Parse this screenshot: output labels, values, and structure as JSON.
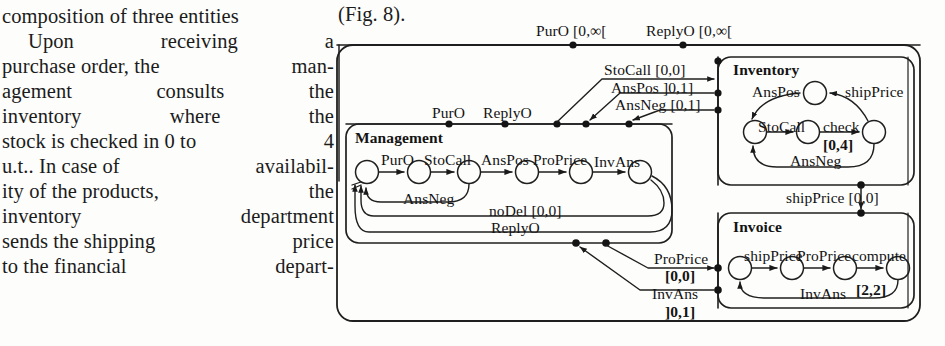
{
  "document_text": {
    "lines": [
      {
        "text": "composition of three entities",
        "type": "plain"
      },
      {
        "type": "just",
        "indent": true,
        "words": [
          "Upon",
          "receiving",
          "a"
        ]
      },
      {
        "type": "just",
        "words": [
          "purchase order, the",
          "man-"
        ]
      },
      {
        "type": "just",
        "words": [
          "agement",
          "consults",
          "the"
        ]
      },
      {
        "type": "just",
        "words": [
          "inventory",
          "where",
          "the"
        ]
      },
      {
        "type": "just",
        "words": [
          "stock is checked in 0 to",
          "4"
        ]
      },
      {
        "type": "just",
        "words": [
          "u.t.. In case of",
          "availabil-"
        ]
      },
      {
        "type": "just",
        "words": [
          "ity of the products,",
          "the"
        ]
      },
      {
        "type": "just",
        "words": [
          "inventory",
          "department"
        ]
      },
      {
        "type": "just",
        "words": [
          "sends the shipping",
          "price"
        ]
      },
      {
        "type": "just",
        "words": [
          "to the financial",
          "depart-"
        ]
      }
    ],
    "figure_ref": "(Fig. 8)."
  },
  "figure": {
    "caption_inline": "(Fig. 8).",
    "outer_port_labels": [
      {
        "id": "puro-top",
        "text": "PurO [0,∞["
      },
      {
        "id": "replyo-top",
        "text": "ReplyO [0,∞["
      }
    ],
    "connector_labels": [
      {
        "id": "stocall-conn",
        "text": "StoCall",
        "interval": "[0,0]"
      },
      {
        "id": "anspos-conn",
        "text": "AnsPos",
        "interval": "]0,1]"
      },
      {
        "id": "ansneg-conn",
        "text": "AnsNeg",
        "interval": "[0,1]"
      },
      {
        "id": "shipprice-conn",
        "text": "shipPrice",
        "interval": "[0,0]"
      },
      {
        "id": "proprice-conn",
        "text": "ProPrice",
        "interval": "[0,0]"
      },
      {
        "id": "invans-conn",
        "text": "InvAns",
        "interval": "]0,1]"
      }
    ],
    "bus_labels": [
      {
        "id": "bus-puro",
        "text": "PurO"
      },
      {
        "id": "bus-replyo",
        "text": "ReplyO"
      }
    ],
    "components": [
      {
        "id": "management",
        "title": "Management",
        "states": 6,
        "transitions": [
          {
            "label": "PurO",
            "interval": ""
          },
          {
            "label": "StoCall",
            "interval": ""
          },
          {
            "label": "AnsPos",
            "interval": ""
          },
          {
            "label": "ProPrice",
            "interval": ""
          },
          {
            "label": "InvAns",
            "interval": ""
          },
          {
            "label": "AnsNeg",
            "interval": ""
          },
          {
            "label": "noDel",
            "interval": "[0,0]"
          },
          {
            "label": "ReplyO",
            "interval": ""
          }
        ]
      },
      {
        "id": "inventory",
        "title": "Inventory",
        "states": 4,
        "transitions": [
          {
            "label": "StoCall",
            "interval": ""
          },
          {
            "label": "check",
            "interval": "[0,4]"
          },
          {
            "label": "shipPrice",
            "interval": ""
          },
          {
            "label": "AnsPos",
            "interval": ""
          },
          {
            "label": "AnsNeg",
            "interval": ""
          }
        ]
      },
      {
        "id": "invoice",
        "title": "Invoice",
        "states": 4,
        "transitions": [
          {
            "label": "shipPrice",
            "interval": ""
          },
          {
            "label": "ProPrice",
            "interval": ""
          },
          {
            "label": "compute",
            "interval": "[2,2]"
          },
          {
            "label": "InvAns",
            "interval": ""
          }
        ]
      }
    ],
    "colors": {
      "ink": "#141414",
      "line": "#2a2a2a",
      "paper": "#fdfdfb"
    }
  }
}
